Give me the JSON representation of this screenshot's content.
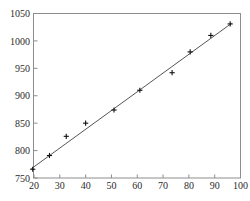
{
  "chart_data": {
    "type": "scatter",
    "title": "",
    "subtitle": "",
    "xlabel": "",
    "ylabel": "",
    "xlim": [
      20,
      100
    ],
    "ylim": [
      750,
      1050
    ],
    "xticks": [
      20,
      30,
      40,
      50,
      60,
      70,
      80,
      90,
      100
    ],
    "yticks": [
      750,
      800,
      850,
      900,
      950,
      1000,
      1050
    ],
    "xtick_labels": [
      "20",
      "30",
      "40",
      "50",
      "60",
      "70",
      "80",
      "90",
      "100"
    ],
    "ytick_labels": [
      "750",
      "800",
      "850",
      "900",
      "950",
      "1000",
      "1050"
    ],
    "grid": false,
    "legend": null,
    "marker": "plus",
    "marker_color": "#111111",
    "points": [
      {
        "x": 19.5,
        "y": 766
      },
      {
        "x": 26.0,
        "y": 791
      },
      {
        "x": 32.5,
        "y": 826
      },
      {
        "x": 40.0,
        "y": 850
      },
      {
        "x": 51.0,
        "y": 874
      },
      {
        "x": 61.0,
        "y": 910
      },
      {
        "x": 73.5,
        "y": 942
      },
      {
        "x": 80.5,
        "y": 980
      },
      {
        "x": 88.5,
        "y": 1010
      },
      {
        "x": 96.0,
        "y": 1031
      }
    ],
    "series": [
      {
        "name": "observations",
        "x": [
          19.5,
          26.0,
          32.5,
          40.0,
          51.0,
          61.0,
          73.5,
          80.5,
          88.5,
          96.0
        ],
        "values": [
          766,
          791,
          826,
          850,
          874,
          910,
          942,
          980,
          1010,
          1031
        ]
      },
      {
        "name": "fitted-line",
        "type": "line",
        "color": "#555555",
        "x": [
          19.0,
          96.5
        ],
        "values": [
          767,
          1032
        ]
      }
    ],
    "annotations": []
  },
  "axes": {
    "frame_color": "#8d8d8d",
    "background": "#ffffff",
    "tick_label_color": "#2b2b2b"
  }
}
